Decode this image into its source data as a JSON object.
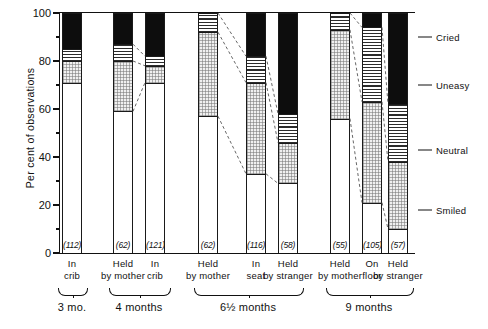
{
  "axis": {
    "ylabel": "Per cent of observations",
    "yticks": [
      0,
      20,
      40,
      60,
      80,
      100
    ],
    "ytick_labels": [
      "0",
      "20",
      "40",
      "60",
      "80",
      "100"
    ],
    "yminor": [
      10,
      30,
      50,
      70,
      90
    ],
    "ylim": [
      0,
      100
    ]
  },
  "legend": {
    "items": [
      {
        "label": "Cried",
        "pattern": "solid-black",
        "color": "#0d0d0d",
        "y_pct": 90
      },
      {
        "label": "Uneasy",
        "pattern": "horizontal-lines",
        "color": "#2b2b2b",
        "y_pct": 70
      },
      {
        "label": "Neutral",
        "pattern": "stipple",
        "color": "#f0f0f0",
        "y_pct": 43
      },
      {
        "label": "Smiled",
        "pattern": "white",
        "color": "#ffffff",
        "y_pct": 18
      }
    ]
  },
  "groups": [
    {
      "label": "3 mo.",
      "bars": [
        0
      ]
    },
    {
      "label": "4 months",
      "bars": [
        1,
        2
      ]
    },
    {
      "label": "6½ months",
      "bars": [
        3,
        4,
        5
      ]
    },
    {
      "label": "9 months",
      "bars": [
        6,
        7,
        8
      ]
    }
  ],
  "chart_data": {
    "type": "bar",
    "title": "",
    "xlabel": "",
    "ylabel": "Per cent of observations",
    "ylim": [
      0,
      100
    ],
    "grid": false,
    "legend_position": "right",
    "stacked": true,
    "categories": [
      "In crib",
      "Held by mother",
      "In crib",
      "Held by mother",
      "In seat",
      "Held by stranger",
      "Held by mother",
      "On floor",
      "Held by stranger"
    ],
    "group_labels": [
      "3 mo.",
      "4 months",
      "4 months",
      "6½ months",
      "6½ months",
      "6½ months",
      "9 months",
      "9 months",
      "9 months"
    ],
    "sample_sizes": [
      112,
      62,
      121,
      62,
      116,
      58,
      55,
      105,
      57
    ],
    "sample_size_labels": [
      "(112)",
      "(62)",
      "(121)",
      "(62)",
      "(116)",
      "(58)",
      "(55)",
      "(105)",
      "(57)"
    ],
    "series": [
      {
        "name": "Smiled",
        "values": [
          71,
          59,
          71,
          57,
          33,
          29,
          56,
          21,
          10
        ]
      },
      {
        "name": "Neutral",
        "values": [
          9,
          21,
          7,
          35,
          38,
          17,
          37,
          42,
          28
        ]
      },
      {
        "name": "Uneasy",
        "values": [
          5,
          7,
          4,
          8,
          11,
          12,
          7,
          31,
          24
        ]
      },
      {
        "name": "Cried",
        "values": [
          15,
          13,
          18,
          0,
          18,
          42,
          0,
          6,
          38
        ]
      }
    ],
    "cumulative_tops": {
      "Smiled": [
        71,
        59,
        71,
        57,
        33,
        29,
        56,
        21,
        10
      ],
      "Neutral": [
        80,
        80,
        78,
        92,
        71,
        46,
        93,
        63,
        38
      ],
      "Uneasy": [
        85,
        87,
        82,
        100,
        82,
        58,
        100,
        94,
        62
      ],
      "Cried": [
        100,
        100,
        100,
        100,
        100,
        100,
        100,
        100,
        100
      ]
    }
  }
}
